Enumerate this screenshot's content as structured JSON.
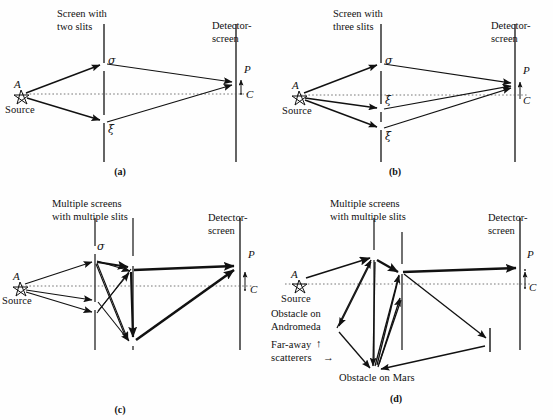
{
  "figure": {
    "background_color": "#fefefe",
    "ink_color": "#111111"
  },
  "panels": [
    {
      "id": "a",
      "caption": "(a)",
      "screen_header": "Screen with\ntwo slits",
      "detector_header": "Detector-\nscreen",
      "source_label": "A",
      "source_name": "Source",
      "detector_point": "P",
      "detector_center": "C",
      "slit_labels": [
        "σ",
        "ξ"
      ],
      "slit_count": 2
    },
    {
      "id": "b",
      "caption": "(b)",
      "screen_header": "Screen with\nthree slits",
      "detector_header": "Detector-\nscreen",
      "source_label": "A",
      "source_name": "Source",
      "detector_point": "P",
      "detector_center": "C",
      "slit_labels": [
        "σ",
        "ξ",
        "ξ"
      ],
      "slit_count": 3
    },
    {
      "id": "c",
      "caption": "(c)",
      "screen_header": "Multiple screens\nwith multiple slits",
      "detector_header": "Detector-\nscreen",
      "source_label": "A",
      "source_name": "Source",
      "detector_point": "P",
      "detector_center": "C",
      "slit_labels": [
        "σ"
      ],
      "screen_count": 2
    },
    {
      "id": "d",
      "caption": "(d)",
      "screen_header": "Multiple screens\nwith multiple slits",
      "detector_header": "Detector-\nscreen",
      "source_label": "A",
      "source_name": "Source",
      "detector_point": "P",
      "detector_center": "C",
      "obstacle_andromeda": "Obstacle on\nAndromeda",
      "obstacle_mars": "Obstacle on Mars",
      "far_away_scatterers_line1": "Far-away",
      "far_away_scatterers_line2": "scatterers",
      "scatterer_arrow_up": "↑",
      "scatterer_arrow_right": "→",
      "screen_count": 2
    }
  ]
}
